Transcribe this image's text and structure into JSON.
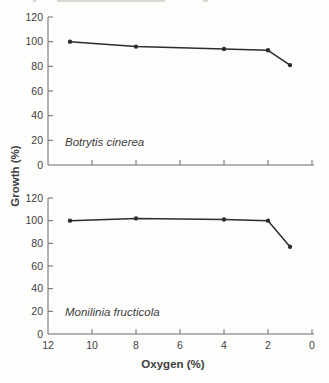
{
  "page": {
    "background": "#fdfdfc"
  },
  "figure": {
    "xlabel": "Oxygen (%)",
    "ylabel": "Growth (%)",
    "axis_color": "#6a6a6a",
    "line_color": "#2d2d2d",
    "text_color": "#3e3e3e",
    "tick_font_size": 10.5
  },
  "chart_data": [
    {
      "type": "line",
      "title": "Botrytis cinerea",
      "x": [
        11,
        8,
        4,
        2,
        1
      ],
      "values": [
        100,
        96,
        94,
        93,
        81
      ],
      "xlabel": "Oxygen (%)",
      "ylabel": "Growth (%)",
      "xlim": [
        12,
        0
      ],
      "ylim": [
        0,
        120
      ],
      "xticks": [
        12,
        10,
        8,
        6,
        4,
        2,
        0
      ],
      "yticks": [
        0,
        20,
        40,
        60,
        80,
        100,
        120
      ],
      "x_axis_reversed": true,
      "show_x_tick_labels": false,
      "grid": false,
      "legend": "none",
      "marker": "filled-dot"
    },
    {
      "type": "line",
      "title": "Monilinia fructicola",
      "x": [
        11,
        8,
        4,
        2,
        1
      ],
      "values": [
        100,
        102,
        101,
        100,
        77
      ],
      "xlabel": "Oxygen (%)",
      "ylabel": "Growth (%)",
      "xlim": [
        12,
        0
      ],
      "ylim": [
        0,
        120
      ],
      "xticks": [
        12,
        10,
        8,
        6,
        4,
        2,
        0
      ],
      "yticks": [
        0,
        20,
        40,
        60,
        80,
        100,
        120
      ],
      "x_axis_reversed": true,
      "show_x_tick_labels": true,
      "grid": false,
      "legend": "none",
      "marker": "filled-dot"
    }
  ],
  "artifacts": {
    "top_crop_fragments": [
      {
        "x": 33,
        "w": 3
      },
      {
        "x": 57,
        "w": 108
      },
      {
        "x": 203,
        "w": 5
      }
    ]
  }
}
